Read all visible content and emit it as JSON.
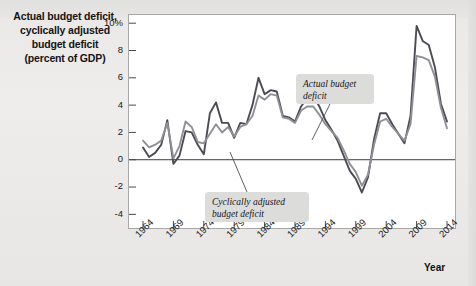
{
  "title": {
    "lines": [
      "Actual budget deficit,",
      "cyclically adjusted",
      "budget deficit",
      "(percent of GDP)"
    ]
  },
  "axis": {
    "x_title": "Year",
    "y_ticks": [
      "10%",
      "8",
      "6",
      "4",
      "2",
      "0",
      "-2",
      "-4"
    ],
    "x_ticks": [
      "1964",
      "1969",
      "1974",
      "1979",
      "1984",
      "1989",
      "1994",
      "1999",
      "2004",
      "2009",
      "2014"
    ]
  },
  "annotations": {
    "actual": {
      "line1": "Actual budget",
      "line2": "deficit"
    },
    "adjusted": {
      "line1": "Cyclically adjusted",
      "line2": "budget deficit"
    }
  },
  "colors": {
    "actual_line": "#4b4b53",
    "adjusted_line": "#8f8f97",
    "plot_bg": "#ffffff",
    "page_bg": "#ebeae8",
    "frame": "#a9a8a6",
    "anno_box": "#dcdcda",
    "text": "#17171a"
  },
  "chart_data": {
    "type": "line",
    "title": "Actual budget deficit, cyclically adjusted budget deficit (percent of GDP)",
    "xlabel": "Year",
    "ylabel": "percent of GDP",
    "xlim": [
      1964,
      2014
    ],
    "ylim": [
      -5,
      10.6
    ],
    "grid": false,
    "legend": "annotations-inline",
    "zero_line": 0,
    "x": [
      1964,
      1965,
      1966,
      1967,
      1968,
      1969,
      1970,
      1971,
      1972,
      1973,
      1974,
      1975,
      1976,
      1977,
      1978,
      1979,
      1980,
      1981,
      1982,
      1983,
      1984,
      1985,
      1986,
      1987,
      1988,
      1989,
      1990,
      1991,
      1992,
      1993,
      1994,
      1995,
      1996,
      1997,
      1998,
      1999,
      2000,
      2001,
      2002,
      2003,
      2004,
      2005,
      2006,
      2007,
      2008,
      2009,
      2010,
      2011,
      2012,
      2013,
      2014
    ],
    "series": [
      {
        "name": "Actual budget deficit",
        "color": "#4b4b53",
        "values": [
          0.9,
          0.2,
          0.5,
          1.1,
          2.9,
          -0.3,
          0.3,
          2.1,
          2.0,
          1.1,
          0.4,
          3.4,
          4.2,
          2.7,
          2.7,
          1.6,
          2.7,
          2.6,
          4.0,
          6.0,
          4.8,
          5.1,
          5.0,
          3.2,
          3.1,
          2.8,
          3.9,
          4.5,
          4.7,
          3.9,
          2.9,
          2.2,
          1.4,
          0.3,
          -0.8,
          -1.4,
          -2.4,
          -1.3,
          1.5,
          3.4,
          3.4,
          2.6,
          1.9,
          1.2,
          3.2,
          9.8,
          8.7,
          8.4,
          6.8,
          4.1,
          2.8
        ]
      },
      {
        "name": "Cyclically adjusted budget deficit",
        "color": "#8f8f97",
        "values": [
          1.4,
          0.9,
          1.1,
          1.4,
          2.7,
          0.1,
          1.0,
          2.8,
          2.4,
          1.3,
          1.2,
          1.9,
          2.6,
          2.0,
          2.4,
          1.7,
          2.4,
          2.6,
          3.2,
          4.7,
          4.4,
          4.8,
          4.7,
          3.1,
          3.0,
          2.7,
          3.6,
          3.9,
          3.9,
          3.3,
          2.6,
          2.1,
          1.6,
          0.7,
          -0.3,
          -0.9,
          -1.9,
          -1.1,
          1.1,
          2.8,
          3.0,
          2.4,
          1.9,
          1.4,
          2.6,
          7.6,
          7.5,
          7.3,
          6.1,
          3.8,
          2.3
        ]
      }
    ]
  }
}
